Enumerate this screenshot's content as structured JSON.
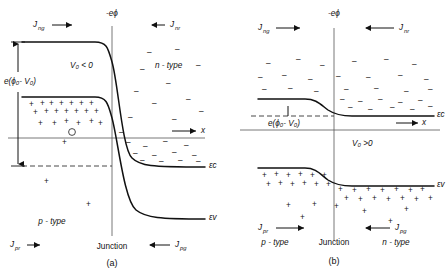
{
  "figure": {
    "panels": [
      {
        "id": "a",
        "caption": "(a)",
        "bias_label": "V₀ < 0",
        "bias_condition": "reverse bias",
        "vertical_axis_label": "-eϕ",
        "barrier_label": "e(ϕ₀- V₀)",
        "x_axis_label": "x",
        "junction_label": "Junction",
        "left_region_label": "p - type",
        "right_region_label": "n - type",
        "conduction_band_label": "εc",
        "valence_band_label": "εv",
        "currents": [
          {
            "name": "Jₙg",
            "symbol": "J",
            "sub": "ng",
            "direction": "right",
            "position": "top-left"
          },
          {
            "name": "Jₙr",
            "symbol": "J",
            "sub": "nr",
            "direction": "left",
            "position": "top-right"
          },
          {
            "name": "Jₚr",
            "symbol": "J",
            "sub": "pr",
            "direction": "right",
            "position": "bottom-left"
          },
          {
            "name": "Jₚg",
            "symbol": "J",
            "sub": "pg",
            "direction": "left",
            "position": "bottom-right"
          }
        ]
      },
      {
        "id": "b",
        "caption": "(b)",
        "bias_label": "V₀ >0",
        "bias_condition": "forward bias",
        "vertical_axis_label": "-eϕ",
        "barrier_label": "e(ϕ₀- V₀)",
        "x_axis_label": "x",
        "junction_label": "Junction",
        "left_region_label": "p - type",
        "right_region_label": "n - type",
        "conduction_band_label": "εc",
        "valence_band_label": "εv",
        "currents": [
          {
            "name": "Jₙg",
            "symbol": "J",
            "sub": "ng",
            "direction": "right",
            "position": "top-left"
          },
          {
            "name": "Jₙr",
            "symbol": "J",
            "sub": "nr",
            "direction": "left",
            "position": "top-right"
          },
          {
            "name": "Jₚr",
            "symbol": "J",
            "sub": "pr",
            "direction": "right",
            "position": "bottom-left"
          },
          {
            "name": "Jₚg",
            "symbol": "J",
            "sub": "pg",
            "direction": "left",
            "position": "bottom-right"
          }
        ]
      }
    ],
    "symbols": {
      "hole": "+",
      "electron": "−",
      "J_letter": "J",
      "e_letter": "e",
      "epsilon": "ε",
      "sub_c": "c",
      "sub_v": "v",
      "sub_ng": "ng",
      "sub_nr": "nr",
      "sub_pr": "pr",
      "sub_pg": "pg",
      "x_letter": "x",
      "minus_e_phi": "−eϕ"
    },
    "colors": {
      "ink": "#111111",
      "axis": "#555555",
      "background": "#ffffff"
    }
  }
}
